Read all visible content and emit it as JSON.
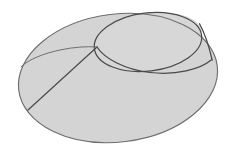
{
  "canvas": {
    "width": 247,
    "height": 157,
    "background_color": "#ffffff",
    "description": "Line drawing of an oblique cone (conical frustum-like solid) shaded light gray"
  },
  "figure": {
    "name": "oblique-cone",
    "fill_color": "#d5d5d5",
    "fill_color_upper": "#d8d8d8",
    "stroke_color": "#4a4a4a",
    "stroke_color_soft": "#6e6e6e",
    "stroke_width": 1.1
  },
  "geometry": {
    "base_ellipse": {
      "name": "base-ellipse",
      "center_x": 118,
      "center_y": 78,
      "radius_x": 100,
      "radius_y": 64,
      "rotation_deg": -7
    },
    "top_ellipse": {
      "name": "top-ellipse",
      "center_x": 148,
      "center_y": 42,
      "radius_x": 54,
      "radius_y": 29,
      "rotation_deg": -7
    },
    "junction_left": {
      "x": 97,
      "y": 47
    },
    "cusp_right": {
      "x": 212,
      "y": 60
    },
    "generator_left_end": {
      "x": 28,
      "y": 110
    },
    "generator_right_start": {
      "x": 200,
      "y": 24
    },
    "top_apex": {
      "x": 145,
      "y": 13
    },
    "base_left_extreme": {
      "x": 18,
      "y": 75
    },
    "base_bottom_extreme": {
      "x": 128,
      "y": 142
    }
  },
  "elements": {
    "base_outline_label": "base ellipse outline",
    "top_rim_label": "top circular rim",
    "far_rim_label": "far rim arc seen through the opening",
    "generator_left_label": "left slant generator line",
    "generator_right_label": "right slant generator line"
  }
}
